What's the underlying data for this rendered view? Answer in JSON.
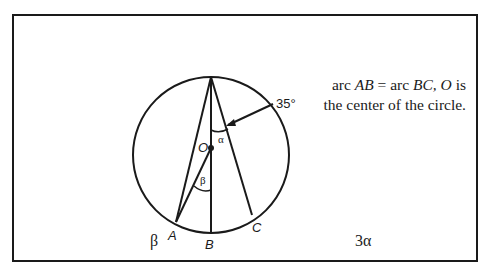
{
  "diagram": {
    "points": {
      "top": "",
      "O": "O",
      "A": "A",
      "B": "B",
      "C": "C"
    },
    "angle_labels": {
      "alpha": "α",
      "beta": "β",
      "given": "35°"
    },
    "caption": {
      "line1_pre": "arc ",
      "line1_ab": "AB",
      "line1_mid": " = arc ",
      "line1_bc": "BC,",
      "line1_o": " O",
      "line1_post": " is",
      "line2": "the center of the circle."
    }
  },
  "columns": {
    "left": "β",
    "right": "3α"
  }
}
